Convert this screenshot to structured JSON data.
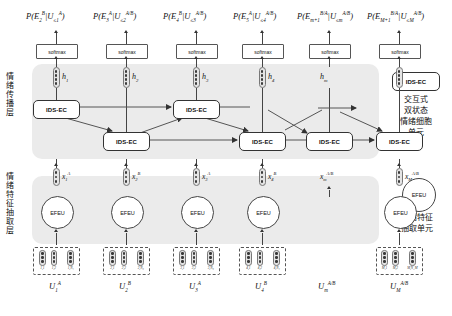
{
  "figure": {
    "type": "neural-network-architecture-diagram",
    "layers": [
      {
        "id": "propagation",
        "cn_label": "情绪传播层",
        "en": "Emotion Propagation Layer"
      },
      {
        "id": "extraction",
        "cn_label": "情绪特征抽取层",
        "en": "Emotion Feature Extraction Layer"
      }
    ]
  },
  "outputs": {
    "softmax_label": "softmax",
    "probabilities": [
      {
        "p": "P(",
        "target": "E",
        "t_sub": "2",
        "t_sup": "B",
        "bar": "|",
        "cond": "U",
        "c_sub": "≤1",
        "c_sup": "A",
        "close": ")"
      },
      {
        "p": "P(",
        "target": "E",
        "t_sub": "3",
        "t_sup": "A",
        "bar": "|",
        "cond": "U",
        "c_sub": "≤2",
        "c_sup": "A/B",
        "close": ")"
      },
      {
        "p": "P(",
        "target": "E",
        "t_sub": "4",
        "t_sup": "B",
        "bar": "|",
        "cond": "U",
        "c_sub": "≤3",
        "c_sup": "A/B",
        "close": ")"
      },
      {
        "p": "P(",
        "target": "E",
        "t_sub": "5",
        "t_sup": "A",
        "bar": "|",
        "cond": "U",
        "c_sub": "≤4",
        "c_sup": "A/B",
        "close": ")"
      },
      {
        "p": "P(",
        "target": "E",
        "t_sub": "m+1",
        "t_sup": "B/A",
        "bar": "|",
        "cond": "U",
        "c_sub": "≤m",
        "c_sup": "A/B",
        "close": ")"
      },
      {
        "p": "P(",
        "target": "E",
        "t_sub": "M+1",
        "t_sup": "B/A",
        "bar": "|",
        "cond": "U",
        "c_sub": "≤M",
        "c_sup": "A/B",
        "close": ")"
      }
    ]
  },
  "hidden_states": [
    {
      "sym": "h",
      "sub": "1"
    },
    {
      "sym": "h",
      "sub": "2"
    },
    {
      "sym": "h",
      "sub": "3"
    },
    {
      "sym": "h",
      "sub": "4"
    },
    {
      "sym": "h",
      "sub": "m"
    },
    {
      "sym": "h",
      "sub": "M"
    }
  ],
  "cells": {
    "name": "IDS-EC",
    "count": 6
  },
  "features": {
    "name": "EFEU",
    "count": 6,
    "states": [
      {
        "sym": "x",
        "sub": "1",
        "sup": "A"
      },
      {
        "sym": "x",
        "sub": "2",
        "sup": "B"
      },
      {
        "sym": "x",
        "sub": "3",
        "sup": "A"
      },
      {
        "sym": "x",
        "sub": "4",
        "sup": "B"
      },
      {
        "sym": "x",
        "sub": "m",
        "sup": "A/B"
      },
      {
        "sym": "x",
        "sub": "M",
        "sup": "A/B"
      }
    ]
  },
  "utterances": [
    {
      "sym": "U",
      "sub": "1",
      "sup": "A",
      "words": [
        "u",
        "u",
        "u"
      ],
      "word_subs": [
        "1,1",
        "1,2",
        "1,N₁"
      ]
    },
    {
      "sym": "U",
      "sub": "2",
      "sup": "B",
      "words": [
        "u",
        "u",
        "u"
      ],
      "word_subs": [
        "2,1",
        "2,2",
        "2,N₂"
      ]
    },
    {
      "sym": "U",
      "sub": "3",
      "sup": "A",
      "words": [
        "u",
        "u",
        "u"
      ],
      "word_subs": [
        "3,1",
        "3,2",
        "3,N₃"
      ]
    },
    {
      "sym": "U",
      "sub": "4",
      "sup": "B",
      "words": [
        "u",
        "u",
        "u"
      ],
      "word_subs": [
        "4,1",
        "4,2",
        "4,N₄"
      ]
    },
    {
      "sym": "U",
      "sub": "m",
      "sup": "A/B",
      "words": [],
      "word_subs": []
    },
    {
      "sym": "U",
      "sub": "M",
      "sup": "A/B",
      "words": [
        "u",
        "u",
        "u"
      ],
      "word_subs": [
        "M,1",
        "M,2",
        "M,N_M"
      ]
    }
  ],
  "legend": [
    {
      "badge": "IDS-EC",
      "cn": [
        "交互式",
        "双状态",
        "情绪细胞",
        "单元"
      ]
    },
    {
      "badge": "EFEU",
      "cn": [
        "情绪特征",
        "抽取单元"
      ]
    }
  ],
  "ellipsis": "···",
  "colors": {
    "band": "#ebebeb",
    "stroke": "#333333",
    "vector_fill": "#e4e4e4",
    "dot": "#3a3a3a",
    "page": "#ffffff"
  }
}
